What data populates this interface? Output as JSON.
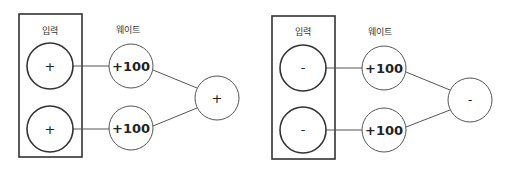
{
  "diagrams": [
    {
      "id": "positive",
      "input_label": "입력",
      "weight_label": "웨이트",
      "inputs": [
        {
          "sign": "+"
        },
        {
          "sign": "+"
        }
      ],
      "weights": [
        {
          "value": "+100"
        },
        {
          "value": "+100"
        }
      ],
      "output": {
        "sign": "+"
      }
    },
    {
      "id": "negative",
      "input_label": "입력",
      "weight_label": "웨이트",
      "inputs": [
        {
          "sign": "-"
        },
        {
          "sign": "-"
        }
      ],
      "weights": [
        {
          "value": "+100"
        },
        {
          "value": "+100"
        }
      ],
      "output": {
        "sign": "-"
      }
    }
  ],
  "colors": {
    "stroke_dark": "#333333",
    "stroke_light": "#555555",
    "background": "#ffffff"
  }
}
